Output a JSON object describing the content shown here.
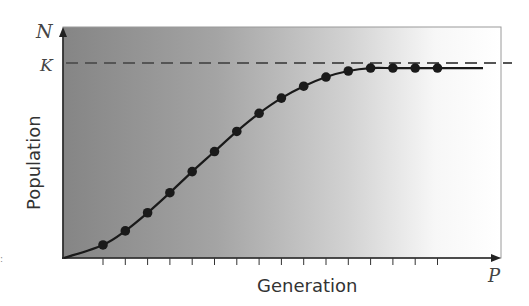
{
  "chart_data": {
    "type": "line",
    "title": "",
    "xlabel": "Generation",
    "ylabel": "Population",
    "x_axis_end_label": "P",
    "y_axis_end_label": "N",
    "reference_line": {
      "label": "K",
      "value": 100,
      "style": "dashed",
      "description": "carrying capacity"
    },
    "x": [
      1,
      2,
      3,
      4,
      5,
      6,
      7,
      8,
      9,
      10,
      11,
      12,
      13,
      14,
      15,
      16
    ],
    "series": [
      {
        "name": "Population",
        "marker": "circle",
        "values": [
          6.7,
          13.9,
          23.2,
          33.5,
          44.3,
          54.6,
          64.9,
          74.2,
          82.0,
          88.1,
          92.8,
          95.9,
          97.4,
          97.4,
          97.4,
          97.4
        ]
      }
    ],
    "curve_type": "logistic",
    "ylim": [
      0,
      118
    ],
    "xlim": [
      0,
      18
    ],
    "grid": false,
    "x_ticks": 16,
    "y_ticks": [],
    "background": "horizontal gradient gray to white",
    "colors": {
      "gradient_left": "#8a8a8a",
      "gradient_right": "#ffffff",
      "line": "#1a1a1a",
      "dash": "#555555",
      "border": "#9a9a9a"
    }
  },
  "labels": {
    "y_axis_symbol": "N",
    "k_symbol": "K",
    "y_axis_title": "Population",
    "x_axis_title": "Generation",
    "x_axis_symbol": "P"
  }
}
